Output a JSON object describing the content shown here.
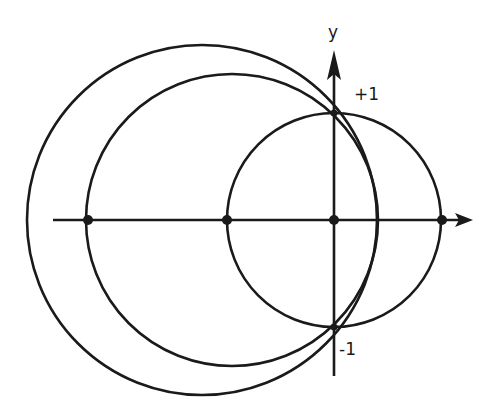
{
  "diagram": {
    "axis_labels": {
      "y": "y"
    },
    "tick_labels": {
      "plus_one": "+1",
      "minus_one": "-1"
    },
    "stroke_color": "#1a1a1a",
    "origin_px": [
      334,
      220
    ],
    "unit_px": 107,
    "circles": [
      {
        "name": "unit-circle",
        "cx": 334,
        "cy": 220,
        "r": 107
      },
      {
        "name": "medium-circle",
        "cx": 232,
        "cy": 220,
        "r": 146
      },
      {
        "name": "large-circle",
        "cx": 202,
        "cy": 220,
        "r": 175
      }
    ],
    "points_on_x_axis": [
      88,
      227,
      334,
      442
    ]
  }
}
